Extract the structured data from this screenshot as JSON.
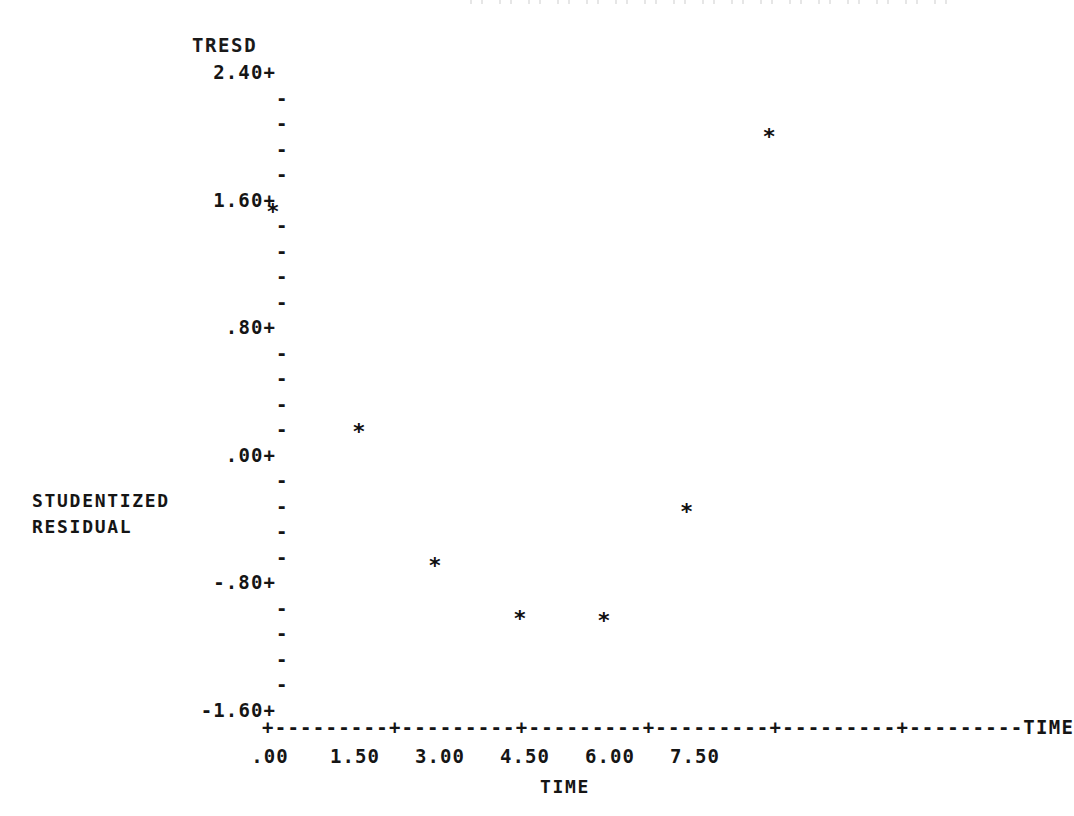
{
  "chart_data": {
    "type": "scatter",
    "title": "TRESD",
    "xlabel": "TIME",
    "ylabel": "STUDENTIZED RESIDUAL",
    "y_axis_name": "TRESD",
    "x_axis_end_label": "TIME",
    "grid": false,
    "legend": null,
    "marker": "*",
    "xlim": [
      0.0,
      8.85
    ],
    "ylim": [
      -1.6,
      2.4
    ],
    "x_ticks": [
      ".00",
      "1.50",
      "3.00",
      "4.50",
      "6.00",
      "7.50"
    ],
    "x_tick_values": [
      0.0,
      1.5,
      3.0,
      4.5,
      6.0,
      7.5
    ],
    "y_ticks": [
      "2.40+",
      "1.60+",
      ".80+",
      ".00+",
      "-.80+",
      "-1.60+"
    ],
    "y_tick_values": [
      2.4,
      1.6,
      0.8,
      0.0,
      -0.8,
      -1.6
    ],
    "y_minor_ticks_between_majors": 4,
    "major_tick_glyph": "+",
    "minor_tick_glyph": "-",
    "x": [
      0.05,
      1.57,
      2.91,
      4.41,
      5.89,
      7.35,
      8.81
    ],
    "y": [
      1.52,
      0.14,
      -0.7,
      -1.03,
      -1.04,
      -0.36,
      1.99
    ],
    "points": [
      {
        "x": 0.05,
        "y": 1.52
      },
      {
        "x": 1.57,
        "y": 0.14
      },
      {
        "x": 2.91,
        "y": -0.7
      },
      {
        "x": 4.41,
        "y": -1.03
      },
      {
        "x": 5.89,
        "y": -1.04
      },
      {
        "x": 7.35,
        "y": -0.36
      },
      {
        "x": 8.81,
        "y": 1.99
      }
    ]
  },
  "axis": {
    "y_caption_line1": "STUDENTIZED",
    "y_caption_line2": "RESIDUAL",
    "x_caption": "TIME",
    "x_rule_text": "+---------+---------+---------+---------+---------+---------TIME"
  },
  "colors": {
    "ink": "#1a1a1a",
    "paper": "#ffffff",
    "marker": "#101010"
  }
}
